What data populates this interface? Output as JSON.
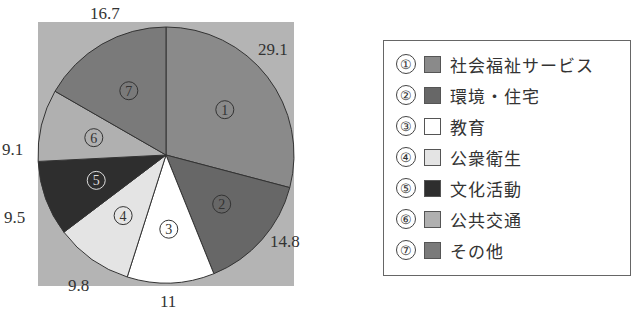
{
  "chart_data": {
    "type": "pie",
    "title": "",
    "start_angle_deg": 0,
    "direction": "clockwise",
    "categories": [
      "社会福祉サービス",
      "環境・住宅",
      "教育",
      "公衆衛生",
      "文化活動",
      "公共交通",
      "その他"
    ],
    "markers": [
      "①",
      "②",
      "③",
      "④",
      "⑤",
      "⑥",
      "⑦"
    ],
    "values": [
      29.1,
      14.8,
      11,
      9.8,
      9.5,
      9.1,
      16.7
    ],
    "value_labels": [
      "29.1",
      "14.8",
      "11",
      "9.8",
      "9.5",
      "9.1",
      "16.7"
    ],
    "colors": [
      "#8a8a8a",
      "#676767",
      "#ffffff",
      "#e4e4e4",
      "#2e2e2e",
      "#b0b0b0",
      "#7a7a7a"
    ],
    "background_color": "#b4b4b4",
    "legend_position": "right"
  },
  "legend": {
    "items": [
      {
        "marker": "①",
        "label": "社会福祉サービス"
      },
      {
        "marker": "②",
        "label": "環境・住宅"
      },
      {
        "marker": "③",
        "label": "教育"
      },
      {
        "marker": "④",
        "label": "公衆衛生"
      },
      {
        "marker": "⑤",
        "label": "文化活動"
      },
      {
        "marker": "⑥",
        "label": "公共交通"
      },
      {
        "marker": "⑦",
        "label": "その他"
      }
    ]
  }
}
